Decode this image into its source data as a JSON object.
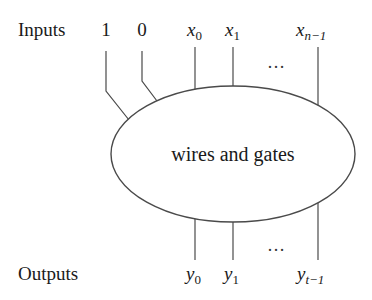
{
  "diagram": {
    "type": "circuit-block",
    "center_label": "wires and gates",
    "inputs": {
      "label": "Inputs",
      "constants": [
        "1",
        "0"
      ],
      "variables": [
        {
          "base": "x",
          "sub": "0"
        },
        {
          "base": "x",
          "sub": "1"
        },
        {
          "base": "x",
          "sub": "n−1"
        }
      ],
      "ellipsis": "…"
    },
    "outputs": {
      "label": "Outputs",
      "variables": [
        {
          "base": "y",
          "sub": "0"
        },
        {
          "base": "y",
          "sub": "1"
        },
        {
          "base": "y",
          "sub": "t−1"
        }
      ],
      "ellipsis": "…"
    },
    "colors": {
      "stroke": "#4a4a4a",
      "text": "#1a1a1a",
      "background": "#ffffff"
    }
  }
}
